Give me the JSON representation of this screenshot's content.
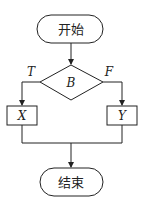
{
  "diagram": {
    "type": "flowchart",
    "nodes": {
      "start": {
        "label": "开始",
        "shape": "terminal"
      },
      "decision": {
        "label": "B",
        "shape": "diamond"
      },
      "process_x": {
        "label": "X",
        "shape": "rectangle"
      },
      "process_y": {
        "label": "Y",
        "shape": "rectangle"
      },
      "end": {
        "label": "结束",
        "shape": "terminal"
      }
    },
    "branches": {
      "true_label": "T",
      "false_label": "F"
    },
    "edges": [
      {
        "from": "start",
        "to": "decision"
      },
      {
        "from": "decision",
        "to": "process_x",
        "label": "T"
      },
      {
        "from": "decision",
        "to": "process_y",
        "label": "F"
      },
      {
        "from": "process_x",
        "to": "end"
      },
      {
        "from": "process_y",
        "to": "end"
      }
    ],
    "colors": {
      "stroke": "#222222",
      "background": "#ffffff",
      "text": "#222222"
    }
  }
}
